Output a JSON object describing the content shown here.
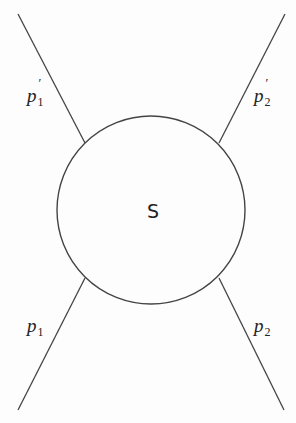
{
  "diagram": {
    "type": "scattering-diagram",
    "center_label": "S",
    "circle": {
      "cx": 151,
      "cy": 210,
      "r": 94,
      "stroke": "#444444"
    },
    "legs": [
      {
        "id": "p1-prime",
        "base": "p",
        "sub": "1",
        "prime": "′",
        "direction": "outgoing-upper-left"
      },
      {
        "id": "p2-prime",
        "base": "p",
        "sub": "2",
        "prime": "′",
        "direction": "outgoing-upper-right"
      },
      {
        "id": "p1",
        "base": "p",
        "sub": "1",
        "prime": "",
        "direction": "incoming-lower-left"
      },
      {
        "id": "p2",
        "base": "p",
        "sub": "2",
        "prime": "",
        "direction": "incoming-lower-right"
      }
    ]
  }
}
